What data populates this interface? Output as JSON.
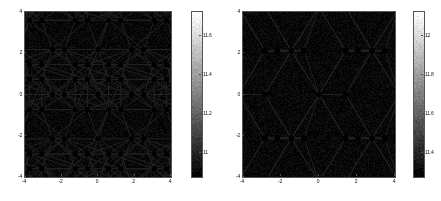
{
  "figure": {
    "type": "two-panel-density-plot",
    "background": "#ffffff",
    "line_color": "#222222",
    "vertex_color": "#000000"
  },
  "chart_data": [
    {
      "panel": "left",
      "type": "heatmap",
      "title": "",
      "xlabel": "",
      "ylabel": "",
      "xlim": [
        -4,
        4
      ],
      "ylim": [
        -4,
        4
      ],
      "xticks": [
        -4,
        -2,
        0,
        2,
        4
      ],
      "xticklabels": [
        "-4",
        "-2",
        "0",
        "2",
        "4"
      ],
      "yticks": [
        -4,
        -2,
        0,
        2,
        4
      ],
      "yticklabels": [
        "-4",
        "-2",
        "0",
        "2",
        "4"
      ],
      "grid": false,
      "colormap": "gray_reversed",
      "colorbar": {
        "position": "right",
        "ticks": [
          11,
          11.2,
          11.4,
          11.6
        ],
        "ticklabels": [
          "11",
          "11.2",
          "11.4",
          "11.6"
        ],
        "vmin": 10.88,
        "vmax": 11.72,
        "orientation": "vertical",
        "white_at": "top",
        "black_at": "bottom"
      },
      "overlay": {
        "name": "honeycomb-lattice-vertical-bonds",
        "bond_orientation": "vertical",
        "vertex_radius": 2.6,
        "lattice_a": 2.5,
        "bond_length": 1.45,
        "vertices": [
          [
            -3.75,
            3.6
          ],
          [
            -1.25,
            3.6
          ],
          [
            1.25,
            3.6
          ],
          [
            3.75,
            3.6
          ],
          [
            -3.75,
            1.45
          ],
          [
            -1.25,
            1.45
          ],
          [
            1.25,
            1.45
          ],
          [
            3.75,
            1.45
          ],
          [
            -2.5,
            0.0
          ],
          [
            0.0,
            0.0
          ],
          [
            2.5,
            0.0
          ],
          [
            -2.5,
            -2.15
          ],
          [
            0.0,
            -2.15
          ],
          [
            2.5,
            -2.15
          ],
          [
            -3.75,
            -3.6
          ],
          [
            -1.25,
            -3.6
          ],
          [
            1.25,
            -3.6
          ],
          [
            3.75,
            -3.6
          ]
        ]
      },
      "density_peaks": {
        "comment": "dark blob centers (hexagon cell centers)",
        "centers": [
          [
            -2.5,
            2.4
          ],
          [
            0.0,
            2.4
          ],
          [
            2.5,
            2.4
          ],
          [
            -3.75,
            -0.3
          ],
          [
            -1.25,
            -0.3
          ],
          [
            1.25,
            -0.3
          ],
          [
            3.75,
            -0.3
          ],
          [
            -2.5,
            -3.0
          ],
          [
            0.0,
            -3.0
          ],
          [
            2.5,
            -3.0
          ]
        ],
        "sigma_x": 0.95,
        "sigma_y": 1.15
      }
    },
    {
      "panel": "right",
      "type": "heatmap",
      "title": "",
      "xlabel": "",
      "ylabel": "",
      "xlim": [
        -4,
        4
      ],
      "ylim": [
        -4,
        4
      ],
      "xticks": [
        -4,
        -2,
        0,
        2,
        4
      ],
      "xticklabels": [
        "-4",
        "-2",
        "0",
        "2",
        "4"
      ],
      "yticks": [
        -4,
        -2,
        0,
        2,
        4
      ],
      "yticklabels": [
        "-4",
        "-2",
        "0",
        "2",
        "4"
      ],
      "grid": false,
      "colormap": "gray_reversed",
      "colorbar": {
        "position": "right",
        "ticks": [
          11.4,
          11.6,
          11.8,
          12
        ],
        "ticklabels": [
          "11.4",
          "11.6",
          "11.8",
          "12"
        ],
        "vmin": 11.28,
        "vmax": 12.12,
        "orientation": "vertical",
        "white_at": "top",
        "black_at": "bottom"
      },
      "overlay": {
        "name": "honeycomb-lattice-horizontal-bonds",
        "bond_orientation": "horizontal",
        "vertex_radius": 2.6,
        "lattice_a": 2.45,
        "bond_length": 1.4,
        "vertices": [
          [
            -2.85,
            2.1
          ],
          [
            -1.45,
            2.1
          ],
          [
            2.05,
            2.1
          ],
          [
            3.45,
            2.1
          ],
          [
            -2.85,
            0.0
          ],
          [
            0.0,
            0.0
          ],
          [
            1.4,
            0.0
          ],
          [
            -2.85,
            -2.1
          ],
          [
            -1.45,
            -2.1
          ],
          [
            2.05,
            -2.1
          ],
          [
            3.45,
            -2.1
          ]
        ]
      },
      "density_peaks": {
        "comment": "dark blob centers (hexagon cell centers)",
        "centers": [
          [
            -3.9,
            2.1
          ],
          [
            0.6,
            2.55
          ],
          [
            3.0,
            2.9
          ],
          [
            -1.5,
            0.0
          ],
          [
            3.1,
            -0.1
          ],
          [
            -3.9,
            -2.1
          ],
          [
            0.6,
            -2.5
          ],
          [
            3.0,
            -2.9
          ],
          [
            -1.3,
            3.9
          ],
          [
            0.7,
            -4.0
          ],
          [
            -3.8,
            4.0
          ]
        ],
        "sigma_x": 0.9,
        "sigma_y": 1.25
      }
    }
  ]
}
